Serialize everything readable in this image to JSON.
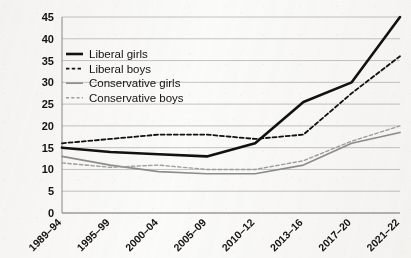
{
  "chart_data": {
    "type": "line",
    "title": "",
    "subtitle": "",
    "xlabel": "",
    "ylabel": "",
    "ylim": [
      0,
      45
    ],
    "yticks": [
      0,
      5,
      10,
      15,
      20,
      25,
      30,
      35,
      40,
      45
    ],
    "ytick_labels": [
      "0",
      "5",
      "10",
      "15",
      "20",
      "25",
      "30",
      "35",
      "40",
      "45"
    ],
    "grid": true,
    "legend_position": "upper-left-inside",
    "categories": [
      "1989–94",
      "1995–99",
      "2000–04",
      "2005–09",
      "2010–12",
      "2013–16",
      "2017–20",
      "2021–22"
    ],
    "series": [
      {
        "name": "Liberal girls",
        "style": "solid",
        "color": "#111111",
        "width": 2.6,
        "values": [
          15,
          14,
          13.5,
          13,
          16,
          25.5,
          30,
          45
        ]
      },
      {
        "name": "Liberal boys",
        "style": "dashed",
        "color": "#111111",
        "width": 1.8,
        "values": [
          16,
          17,
          18,
          18,
          17,
          18,
          27.5,
          36
        ]
      },
      {
        "name": "Conservative girls",
        "style": "solid",
        "color": "#8e8e8e",
        "width": 1.6,
        "values": [
          13,
          11,
          9.5,
          9,
          9,
          11,
          16,
          18.5
        ]
      },
      {
        "name": "Conservative boys",
        "style": "dashed",
        "color": "#a0a0a0",
        "width": 1.4,
        "values": [
          11.5,
          10.5,
          11,
          10,
          10,
          12,
          16.5,
          20
        ]
      }
    ]
  },
  "legend": {
    "items": [
      {
        "label": "Liberal girls"
      },
      {
        "label": "Liberal boys"
      },
      {
        "label": "Conservative girls"
      },
      {
        "label": "Conservative boys"
      }
    ]
  }
}
